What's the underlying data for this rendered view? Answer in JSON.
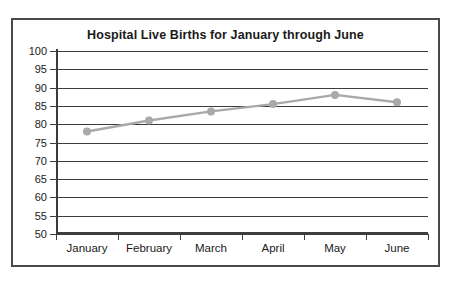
{
  "figure": {
    "title": "Hospital Live Births for January through June",
    "border_color": "#4a4a4a",
    "background": "#ffffff"
  },
  "axes": {
    "y_tick_labels": [
      "100",
      "95",
      "90",
      "85",
      "80",
      "75",
      "70",
      "65",
      "60",
      "55",
      "50"
    ],
    "x_tick_labels": [
      "January",
      "February",
      "March",
      "April",
      "May",
      "June"
    ],
    "axis_color": "#3c3c3c",
    "grid": true
  },
  "chart_data": {
    "type": "line",
    "title": "Hospital Live Births for January through June",
    "xlabel": "",
    "ylabel": "",
    "categories": [
      "January",
      "February",
      "March",
      "April",
      "May",
      "June"
    ],
    "values": [
      78,
      81,
      83.5,
      85.5,
      88,
      86
    ],
    "ylim": [
      50,
      100
    ],
    "ytick_step": 5,
    "yticks": [
      50,
      55,
      60,
      65,
      70,
      75,
      80,
      85,
      90,
      95,
      100
    ],
    "grid": true,
    "legend": false,
    "series_color": "#a9a9a9",
    "marker": "circle",
    "marker_color": "#a9a9a9"
  }
}
